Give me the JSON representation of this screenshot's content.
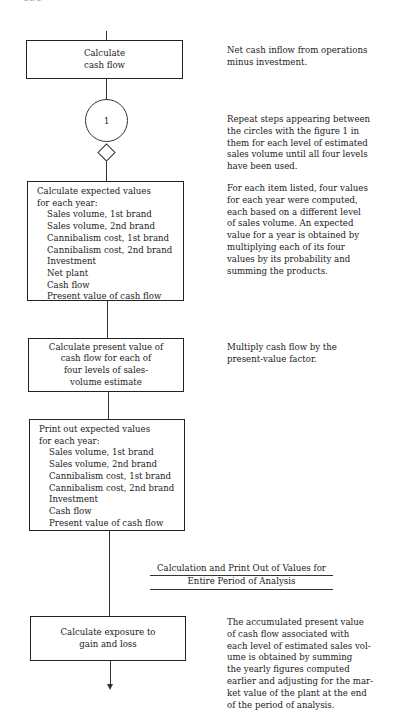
{
  "page": {
    "header_fragment": "336"
  },
  "flowchart": {
    "steps": [
      {
        "id": "calculate-cash-flow",
        "lines": [
          "Calculate",
          "cash flow"
        ]
      },
      {
        "id": "calculate-expected-values",
        "title_lines": [
          "Calculate expected values",
          "for each year:"
        ],
        "items": [
          "Sales volume, 1st brand",
          "Sales volume, 2nd brand",
          "Cannibalism cost, 1st brand",
          "Cannibalism cost, 2nd brand",
          "Investment",
          "Net plant",
          "Cash flow",
          "Present value of cash flow"
        ]
      },
      {
        "id": "calculate-present-value",
        "lines": [
          "Calculate present value of",
          "cash flow for each of",
          "four levels of sales-",
          "volume estimate"
        ]
      },
      {
        "id": "print-expected-values",
        "title_lines": [
          "Print out expected values",
          "for each year:"
        ],
        "items": [
          "Sales volume, 1st brand",
          "Sales volume, 2nd brand",
          "Cannibalism cost, 1st brand",
          "Cannibalism cost, 2nd brand",
          "Investment",
          "Cash flow",
          "Present value of cash flow"
        ]
      },
      {
        "id": "calculate-exposure",
        "lines": [
          "Calculate exposure to",
          "gain and loss"
        ]
      }
    ],
    "connector": {
      "label": "1"
    }
  },
  "notes": [
    {
      "id": "note-cash-flow",
      "lines": [
        "Net cash inflow from operations",
        "minus investment."
      ]
    },
    {
      "id": "note-repeat",
      "lines": [
        "Repeat steps appearing between",
        "the circles with the figure 1 in",
        "them for each level of estimated",
        "sales volume until all four levels",
        "have been used."
      ]
    },
    {
      "id": "note-expected-values",
      "lines": [
        "For each item listed, four values",
        "for each year were computed,",
        "each based on a different level",
        "of sales volume.  An expected",
        "value for a year is obtained by",
        "multiplying each of its four",
        "values by its probability and",
        "summing the products."
      ]
    },
    {
      "id": "note-present-value",
      "lines": [
        "Multiply cash flow by the",
        "present-value factor."
      ]
    },
    {
      "id": "note-exposure",
      "lines": [
        "The accumulated present value",
        "of cash flow associated with",
        "each level of estimated sales vol-",
        "ume is obtained by summing",
        "the yearly figures computed",
        "earlier and adjusting for the mar-",
        "ket value of the plant at the end",
        "of the period of analysis."
      ]
    }
  ],
  "section_heading": {
    "line1": "Calculation and Print Out of Values for",
    "line2": "Entire Period of Analysis"
  }
}
